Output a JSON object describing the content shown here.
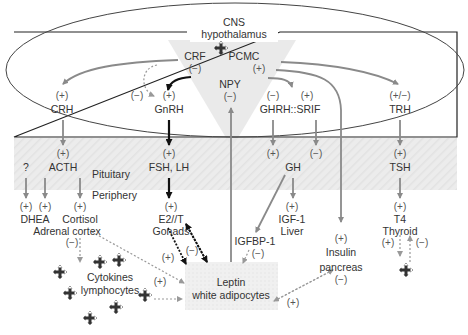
{
  "colors": {
    "solid_arrow": "#8a8a8a",
    "strong_arrow": "#111111",
    "dotted_arrow": "#8a8a8a",
    "box_border": "#222222",
    "pituitary_band": "#e6e6e6",
    "triangle": "#e3e3e3",
    "leptin_box": "#ededed",
    "text": "#333333"
  },
  "regions": {
    "cns": "CNS",
    "hypothalamus": "hypothalamus",
    "pituitary": "Pituitary",
    "periphery": "Periphery"
  },
  "nodes": {
    "crf": {
      "label": "CRF",
      "sign": "(−)"
    },
    "pcmc": {
      "label": "PCMC",
      "sign": "(+)"
    },
    "npy": {
      "label": "NPY",
      "sign": "(−)"
    },
    "crh": {
      "label": "CRH",
      "sign": "(+)"
    },
    "gnrh": {
      "label": "GnRH",
      "sign": "(+)",
      "input_sign": "(−)"
    },
    "ghrh_srif": {
      "label": "GHRH::SRIF",
      "sign_left": "(−)",
      "sign_right": "(+)"
    },
    "trh": {
      "label": "TRH",
      "sign": "(+/−)"
    },
    "acth": {
      "label": "ACTH",
      "sign": "(+)"
    },
    "unknown": {
      "label": "?"
    },
    "fsh_lh": {
      "label": "FSH, LH",
      "sign": "(+)"
    },
    "gh": {
      "label": "GH",
      "sign_left": "(+)",
      "sign_right": "(−)"
    },
    "tsh": {
      "label": "TSH",
      "sign": "(+)"
    },
    "dhea": {
      "label": "DHEA",
      "sign": "(+)"
    },
    "dhea_q_sign": "(+)",
    "cortisol": {
      "label": "Cortisol",
      "sign": "(+)"
    },
    "adrenal": {
      "label": "Adrenal cortex",
      "sign": "(−)"
    },
    "e2t": {
      "label": "E2//T",
      "sign": "(+)"
    },
    "gonads": {
      "label": "Gonads",
      "sign_in": "(+)",
      "sign_out": "(−)"
    },
    "igf1": {
      "label": "IGF-1",
      "sign": "(+)"
    },
    "liver": {
      "label": "Liver"
    },
    "igfbp1": {
      "label": "IGFBP-1",
      "sign": "(−)"
    },
    "insulin": {
      "label": "Insulin",
      "sign": "(+)"
    },
    "pancreas": {
      "label": "pancreas",
      "sign": "(−)"
    },
    "leptin_pancreas_sign": "(+)",
    "t4": {
      "label": "T4",
      "sign": "(+)"
    },
    "thyroid": {
      "label": "Thyroid",
      "sign_left": "(+)",
      "sign_right": "(−)"
    },
    "cytokines": {
      "label": "Cytokines",
      "label2": "lymphocytes",
      "sign": "(+)"
    },
    "leptin": {
      "label": "Leptin",
      "label2": "white adipocytes"
    }
  },
  "icons": [
    "cytokine-cross-icon"
  ]
}
